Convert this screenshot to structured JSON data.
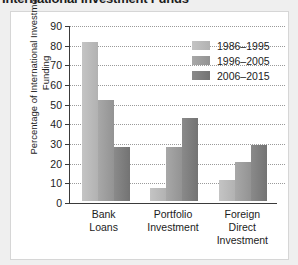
{
  "chart_data": {
    "type": "bar",
    "title": "International Investment Funds",
    "xlabel": "",
    "ylabel": "Percentage of International Investment Funding",
    "ylim": [
      0,
      90
    ],
    "ytick_step": 10,
    "yticks": [
      90,
      80,
      70,
      60,
      50,
      40,
      30,
      20,
      10,
      0
    ],
    "grid": true,
    "legend_position": "top-right",
    "categories": [
      "Bank Loans",
      "Portfolio Investment",
      "Foreign Direct Investment"
    ],
    "category_lines": [
      [
        "Bank",
        "Loans"
      ],
      [
        "Portfolio",
        "Investment"
      ],
      [
        "Foreign",
        "Direct",
        "Investment"
      ]
    ],
    "series": [
      {
        "name": "1986–1995",
        "color": "#bbbbbb",
        "values": [
          82,
          7,
          11
        ]
      },
      {
        "name": "1996–2005",
        "color": "#9d9d9d",
        "values": [
          52,
          28,
          20
        ]
      },
      {
        "name": "2006–2015",
        "color": "#7e7e7e",
        "values": [
          28,
          43,
          29
        ]
      }
    ]
  },
  "panel": {
    "background": "#ffffff",
    "border_color": "#d6d6d6",
    "page_background": "#efefef",
    "axis_color": "#3a3a3a",
    "gridline_color": "#9a9a9a"
  }
}
